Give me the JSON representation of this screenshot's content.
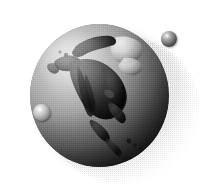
{
  "image": {
    "kind": "rendered-3d-illustration",
    "subject": "grayscale globe of Earth showing North America",
    "title": "Earth globe with two small spheres",
    "background_color": "#ffffff",
    "width": 202,
    "height": 184,
    "color_mode": "grayscale"
  },
  "globe": {
    "name": "earth-globe",
    "visible_region": "North America",
    "landmasses": [
      "Greenland",
      "Canada",
      "United States",
      "Mexico",
      "Central America",
      "Alaska"
    ],
    "center_x": 99,
    "center_y": 93,
    "diameter": 139,
    "light_direction": "upper-left",
    "highlight_color": "#d9d9d9",
    "midtone_color": "#8e8e8e",
    "terminator_color": "#0d0d0d",
    "land_color": "#2b2b2b",
    "ice_cap_color": "#e4e4e4"
  },
  "spheres": [
    {
      "name": "satellite-sphere",
      "label": "small dark sphere",
      "x": 169,
      "y": 39,
      "diameter": 16,
      "tone": "dark",
      "highlight_color": "#e8e8e8",
      "shadow_color": "#141414",
      "position_note": "upper right, off the globe, against white background"
    },
    {
      "name": "surface-sphere",
      "label": "small light sphere",
      "x": 41,
      "y": 112,
      "diameter": 17,
      "tone": "light",
      "highlight_color": "#f2f2f2",
      "shadow_color": "#474747",
      "position_note": "lower left, resting on the globe surface"
    }
  ],
  "shadow": {
    "name": "drop-shadow",
    "style": "dithered halftone",
    "direction": "lower-right",
    "opacity_peak": 0.3
  }
}
